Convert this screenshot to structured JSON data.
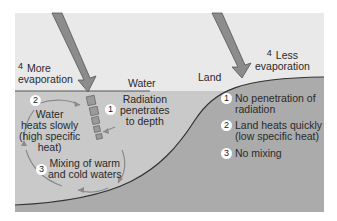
{
  "diagram": {
    "colors": {
      "sky": "#e8e8e8",
      "water": "#c8c8c8",
      "land": "#a9a9a9",
      "arrow": "#8a8a8a",
      "arrow_outline": "#555555",
      "boundary": "#3a3a3a"
    },
    "regions": {
      "water": "Water",
      "land": "Land"
    },
    "water_side": {
      "evaporation": {
        "number": "4",
        "text_line1": "More",
        "text_line2": "evaporation"
      },
      "radiation": {
        "number": "1",
        "text_line1": "Radiation",
        "text_line2": "penetrates",
        "text_line3": "to depth"
      },
      "heating": {
        "number": "2",
        "text_line1": "Water",
        "text_line2": "heats slowly",
        "text_line3": "(high specific",
        "text_line4": "heat)"
      },
      "mixing": {
        "number": "3",
        "text_line1": "Mixing of warm",
        "text_line2": "and cold waters"
      }
    },
    "land_side": {
      "evaporation": {
        "number": "4",
        "text_line1": "Less",
        "text_line2": "evaporation"
      },
      "items": [
        {
          "number": "1",
          "text_line1": "No penetration of",
          "text_line2": "radiation"
        },
        {
          "number": "2",
          "text_line1": "Land heats quickly",
          "text_line2": "(low specific heat)"
        },
        {
          "number": "3",
          "text_line1": "No mixing",
          "text_line2": ""
        }
      ]
    }
  }
}
